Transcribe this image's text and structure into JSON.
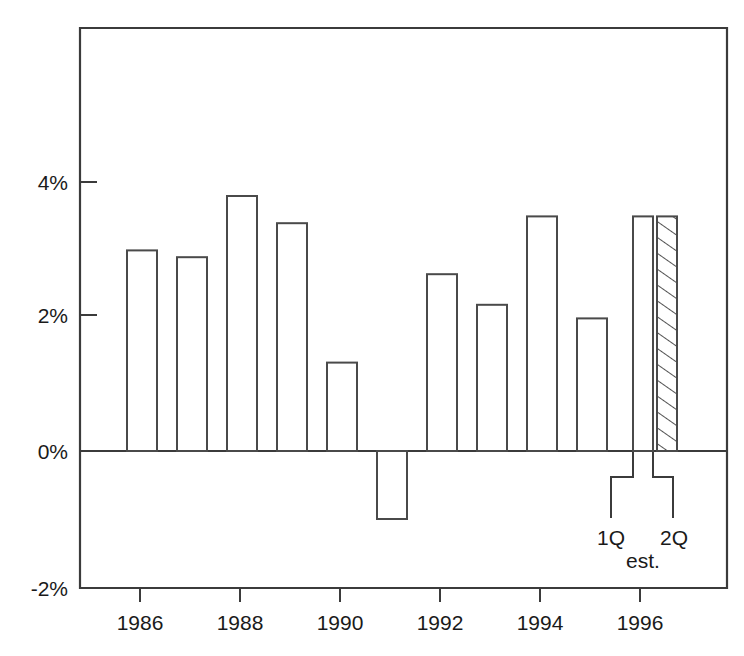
{
  "chart_data": {
    "type": "bar",
    "title": "",
    "subtitle": "",
    "xlabel": "",
    "ylabel": "",
    "grid": false,
    "legend": "none",
    "categories": [
      "1985",
      "1986",
      "1987",
      "1988",
      "1989",
      "1990",
      "1991",
      "1992",
      "1993",
      "1994",
      "1995",
      "1Q",
      "2Q"
    ],
    "values": [
      2.95,
      2.85,
      3.75,
      3.35,
      1.3,
      -1.0,
      2.6,
      2.15,
      3.45,
      1.95,
      3.45,
      3.45,
      3.45
    ],
    "bars": [
      {
        "label": "1986",
        "value": 2.95,
        "style": "open"
      },
      {
        "label": "1987",
        "value": 2.85,
        "style": "open"
      },
      {
        "label": "1988",
        "value": 3.75,
        "style": "open"
      },
      {
        "label": "1989",
        "value": 3.35,
        "style": "open"
      },
      {
        "label": "1990",
        "value": 1.3,
        "style": "open"
      },
      {
        "label": "1991",
        "value": -1.0,
        "style": "open"
      },
      {
        "label": "1992",
        "value": 2.6,
        "style": "open"
      },
      {
        "label": "1993",
        "value": 2.15,
        "style": "open"
      },
      {
        "label": "1994",
        "value": 3.45,
        "style": "open"
      },
      {
        "label": "1995",
        "value": 1.95,
        "style": "open"
      },
      {
        "label": "1Q",
        "value": 3.45,
        "style": "open"
      },
      {
        "label": "2Q",
        "value": 3.45,
        "style": "hatched"
      }
    ],
    "ylim": [
      -2.8,
      5.4
    ],
    "yticks": [
      4,
      2,
      0,
      -2
    ],
    "ytick_labels": [
      "4%",
      "2%",
      "0%",
      "-2%"
    ],
    "xticks": [
      1986,
      1988,
      1990,
      1992,
      1994,
      1996
    ],
    "xtick_labels": [
      "1986",
      "1988",
      "1990",
      "1992",
      "1994",
      "1996"
    ],
    "annotations": [
      {
        "name": "first-quarter",
        "text": "1Q"
      },
      {
        "name": "second-quarter",
        "text": "2Q"
      },
      {
        "name": "estimate-note",
        "text": "est."
      }
    ],
    "colors": {
      "bar_fill": "#ffffff",
      "bar_stroke": "#4a4a4a",
      "axis": "#3b3b3b",
      "text": "#1a1a1a",
      "background": "#ffffff"
    }
  }
}
